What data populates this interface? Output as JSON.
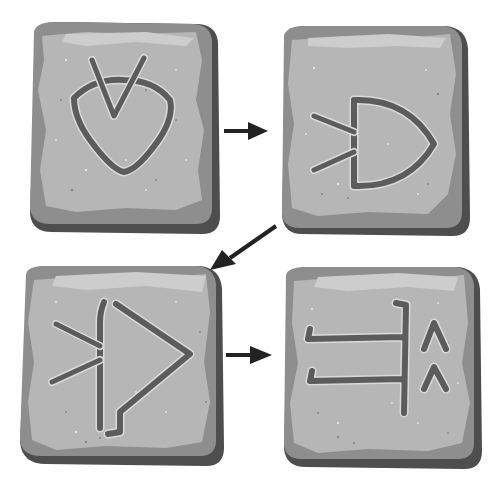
{
  "diagram": {
    "sequence": [
      {
        "step": 1,
        "glyph": "heart-shape crossed by a V"
      },
      {
        "step": 2,
        "glyph": "D-shape with two converging lines on the left"
      },
      {
        "step": 3,
        "glyph": "triangle pointing right with a vertical bar and converging lines"
      },
      {
        "step": 4,
        "glyph": "vertical bar with two horizontal hooks and two caret marks"
      }
    ],
    "flow": [
      "step 1 → step 2",
      "step 2 → step 3",
      "step 3 → step 4"
    ]
  },
  "colors": {
    "background": "#ffffff",
    "stone_face": "#b4b4b4",
    "stone_face_light": "#c6c6c6",
    "stone_edge": "#8c8c8c",
    "stone_side": "#5a5a5a",
    "stone_outline": "#3c3c3c",
    "groove": "#606060",
    "groove_highlight": "#dadada",
    "arrow": "#222222"
  }
}
